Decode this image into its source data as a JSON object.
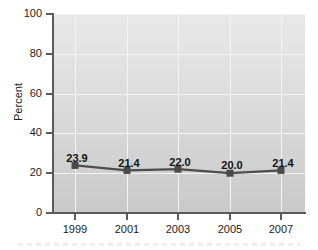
{
  "chart_data": {
    "type": "line",
    "title": "",
    "subtitle": "",
    "xlabel": "",
    "ylabel": "Percent",
    "categories": [
      "1999",
      "2001",
      "2003",
      "2005",
      "2007"
    ],
    "x": [
      1999,
      2001,
      2003,
      2005,
      2007
    ],
    "values": [
      23.9,
      21.4,
      22.0,
      20.0,
      21.4
    ],
    "data_labels": [
      "23.9",
      "21.4",
      "22.0",
      "20.0",
      "21.4"
    ],
    "ylim": [
      0,
      100
    ],
    "ytick_labels": [
      "0",
      "20",
      "40",
      "60",
      "80",
      "100"
    ],
    "ytick_values": [
      0,
      20,
      40,
      60,
      80,
      100
    ],
    "xtick_labels": [
      "1999",
      "2001",
      "2003",
      "2005",
      "2007"
    ],
    "grid": true,
    "grid_color": "#f4f4f4",
    "legend": false,
    "legend_position": "none",
    "marker": "square",
    "series": [
      {
        "name": "Percent",
        "values": [
          23.9,
          21.4,
          22.0,
          20.0,
          21.4
        ],
        "line_color": "#4d4d4d",
        "marker_color": "#4a4a4a"
      }
    ],
    "plot_background_top": "#e8e8e8",
    "plot_background_bottom": "#c9c9c9",
    "axis_color": "#5b5b5b",
    "text_color": "#1c1c1c"
  }
}
